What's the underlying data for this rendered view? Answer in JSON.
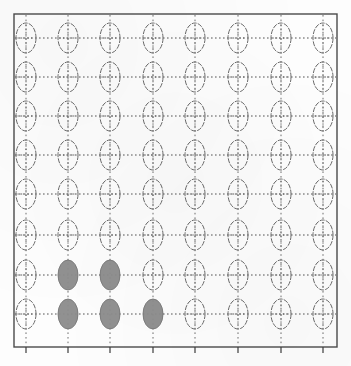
{
  "figure": {
    "kind": "ellipse-glyph-grid",
    "background_color": "#fdfdfd",
    "frame": {
      "stroke_color": "#4a4a4a",
      "stroke_width": 1.4,
      "x": 14,
      "y": 14,
      "width": 323,
      "height": 333
    },
    "axis_ticks": {
      "visible": true,
      "edge": "bottom",
      "stroke_color": "#3d3d3d",
      "length": 6,
      "positions_x": [
        26,
        68,
        110,
        153,
        195,
        238,
        281,
        323
      ]
    }
  },
  "chart_data": {
    "type": "scatter",
    "title": "",
    "subtitle": "",
    "xlabel": "",
    "ylabel": "",
    "grid": false,
    "legend": null,
    "rows": 8,
    "cols": 8,
    "column_centers_x": [
      26,
      68,
      110,
      153,
      195,
      238,
      281,
      323
    ],
    "row_centers_y": [
      38,
      77,
      116,
      155,
      194,
      235,
      275,
      314
    ],
    "glyph": {
      "shape": "ellipse",
      "radius_x": 10,
      "radius_y": 15,
      "outline_color": "#6b6b6b",
      "outline_width": 1.0,
      "fill_color": "#8c8c8c",
      "empty_fill": "none",
      "crosshair_color": "#555555",
      "crosshair_style": "dotted"
    },
    "filled_cells": [
      {
        "row": 7,
        "col": 2
      },
      {
        "row": 7,
        "col": 3
      },
      {
        "row": 8,
        "col": 2
      },
      {
        "row": 8,
        "col": 3
      },
      {
        "row": 8,
        "col": 4
      }
    ],
    "filled_count": 5,
    "total_count": 64,
    "connector_lines": {
      "horizontal": {
        "style": "dotted",
        "color": "#555555",
        "per_row": true
      },
      "vertical": {
        "style": "dotted",
        "color": "#6e6e6e",
        "per_column": true
      }
    }
  }
}
